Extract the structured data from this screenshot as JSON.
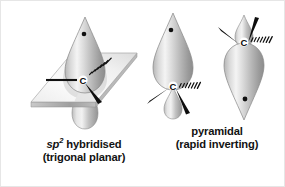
{
  "figure": {
    "name": "carbon-radical-geometry-figure",
    "background_color": "#ffffff",
    "border_color": "#e6e6e6",
    "atom_label": "C",
    "lobe_fill_light": "#f2f2f2",
    "lobe_fill_mid": "#c8c8c8",
    "lobe_fill_dark": "#8e8e8e",
    "plane_fill_light": "#fbfbfb",
    "plane_fill_dark": "#d4d4d4",
    "bond_color": "#111111",
    "electron_color": "#101010"
  },
  "structures": [
    {
      "id": "sp2-hybridised",
      "name": "sp2 hybridised carbon radical with p orbital perpendicular to trigonal planar plane",
      "atom_label": "C",
      "geometry": "trigonal planar",
      "orbital": "p orbital",
      "has_plane": true,
      "electron_dot": "unpaired electron",
      "bonds": [
        {
          "type": "plain-line",
          "direction": "left"
        },
        {
          "type": "hashed-wedge",
          "direction": "upper-right"
        },
        {
          "type": "solid-wedge",
          "direction": "lower-right"
        }
      ]
    },
    {
      "id": "pyramidal-down",
      "name": "pyramidal carbon radical with large lobe pointing up",
      "atom_label": "C",
      "geometry": "pyramidal",
      "orbital": "sp3 orbital",
      "has_plane": false,
      "electron_dot": "unpaired electron",
      "bonds": [
        {
          "type": "solid-wedge",
          "direction": "lower-left"
        },
        {
          "type": "hashed-wedge",
          "direction": "right"
        },
        {
          "type": "solid-wedge",
          "direction": "lower-right"
        }
      ]
    },
    {
      "id": "pyramidal-up",
      "name": "inverted pyramidal carbon radical with large lobe pointing down",
      "atom_label": "C",
      "geometry": "pyramidal inverted",
      "orbital": "sp3 orbital",
      "has_plane": false,
      "electron_dot": "unpaired electron",
      "bonds": [
        {
          "type": "solid-wedge",
          "direction": "upper-left"
        },
        {
          "type": "hashed-wedge",
          "direction": "right"
        },
        {
          "type": "solid-wedge",
          "direction": "upper-right"
        }
      ]
    }
  ],
  "captions": {
    "sp2": {
      "line1_italic": "sp",
      "line1_sup": "2",
      "line1_rest": " hybridised",
      "line2": "(trigonal planar)"
    },
    "pyramidal": {
      "line1": "pyramidal",
      "line2": "(rapid inverting)"
    }
  }
}
